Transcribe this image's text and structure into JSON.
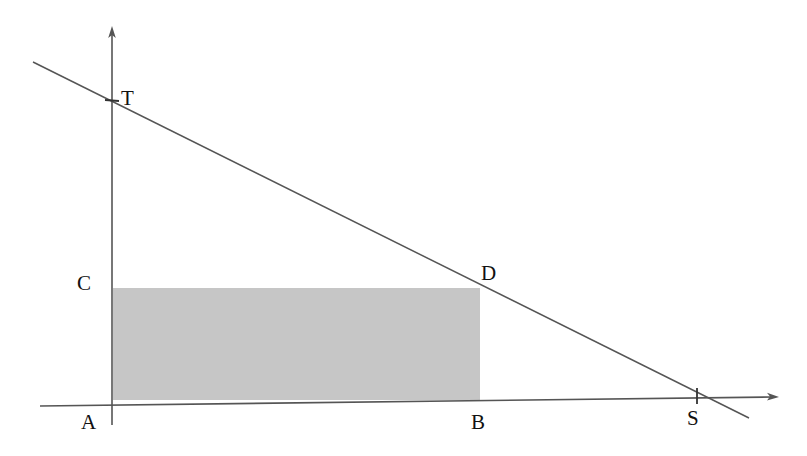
{
  "figure": {
    "background_color": "#ffffff",
    "width": 807,
    "height": 456
  },
  "chart_data": {
    "type": "line",
    "title": "",
    "xlabel": "",
    "ylabel": "",
    "grid": false,
    "legend": false,
    "series": [
      {
        "name": "line-TS",
        "points": [
          {
            "label": "T",
            "x": 112,
            "y": 101
          },
          {
            "label": "D",
            "x": 480,
            "y": 288
          },
          {
            "label": "S",
            "x": 697,
            "y": 397
          }
        ]
      }
    ],
    "shapes": [
      {
        "name": "rectangle-ABDC",
        "type": "rect",
        "vertices": [
          "A",
          "B",
          "D",
          "C"
        ],
        "fill": "#c6c6c6",
        "x": 113,
        "y": 288,
        "width": 367,
        "height": 112
      }
    ],
    "axes": {
      "x_axis": {
        "from": [
          40,
          406
        ],
        "to": [
          778,
          397
        ],
        "arrow": true
      },
      "y_axis": {
        "from": [
          112,
          425
        ],
        "to": [
          112,
          28
        ],
        "arrow": true
      }
    },
    "ticks": [
      {
        "label": "T",
        "axis": "y",
        "x": 112,
        "y": 101
      },
      {
        "label": "S",
        "axis": "x",
        "x": 697,
        "y": 396
      }
    ]
  },
  "labels": {
    "T": {
      "text": "T",
      "x": 121,
      "y": 88
    },
    "C": {
      "text": "C",
      "x": 77,
      "y": 273
    },
    "D": {
      "text": "D",
      "x": 481,
      "y": 263
    },
    "A": {
      "text": "A",
      "x": 81,
      "y": 412
    },
    "B": {
      "text": "B",
      "x": 471,
      "y": 412
    },
    "S": {
      "text": "S",
      "x": 687,
      "y": 408
    }
  },
  "colors": {
    "rectangle_fill": "#c6c6c6",
    "line_stroke": "#555555",
    "axis_stroke": "#555555",
    "label_text": "#111111",
    "background": "#ffffff"
  }
}
